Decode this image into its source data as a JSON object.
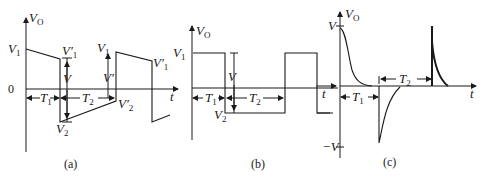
{
  "figure": {
    "panels": [
      {
        "id": "a",
        "caption": "(a)",
        "y_axis_label": "V",
        "y_axis_sub": "O",
        "x_axis_label": "t",
        "origin_label": "0",
        "labels": {
          "v1": "V",
          "v1_sub": "1",
          "v1p_left": "V′",
          "v1p_left_sub": "1",
          "v": "V",
          "v2": "V",
          "v2_sub": "2",
          "v1_right": "V",
          "v1_right_sub": "1",
          "vprime": "V′",
          "v2p": "V′",
          "v2p_sub": "2",
          "v1p_right": "V′",
          "v1p_right_sub": "1",
          "t1": "T",
          "t1_sub": "1",
          "t2": "T",
          "t2_sub": "2"
        }
      },
      {
        "id": "b",
        "caption": "(b)",
        "y_axis_label": "V",
        "y_axis_sub": "O",
        "x_axis_label": "t",
        "labels": {
          "v1": "V",
          "v1_sub": "1",
          "v": "V",
          "v2": "V",
          "v2_sub": "2",
          "t1": "T",
          "t1_sub": "1",
          "t2": "T",
          "t2_sub": "2"
        }
      },
      {
        "id": "c",
        "caption": "(c)",
        "y_axis_label": "V",
        "y_axis_sub": "O",
        "x_axis_label": "t",
        "labels": {
          "v": "V",
          "neg_v": "−V",
          "t1": "T",
          "t1_sub": "1",
          "t2": "T",
          "t2_sub": "2"
        }
      }
    ]
  }
}
